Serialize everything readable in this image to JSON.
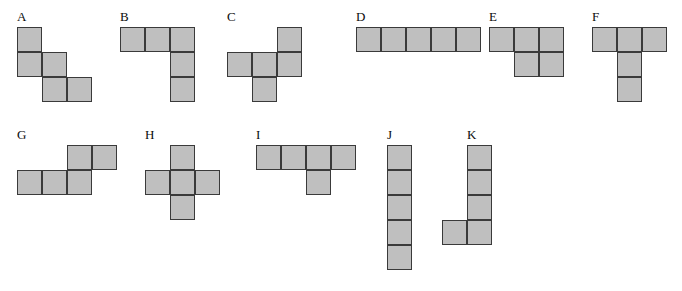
{
  "figure": {
    "background_color": "#ffffff",
    "cell_fill_color": "#bfbfbf",
    "cell_stroke_color": "#3a3a3a",
    "label_color": "#0b0b0b",
    "cell_size": 25,
    "shapes": [
      {
        "label": "A",
        "name": "W-pentomino-staircase",
        "label_x": 17,
        "label_y": 10,
        "origin_x": 17,
        "origin_y": 27,
        "cols": 3,
        "rows": 3,
        "cells": [
          [
            0,
            0
          ],
          [
            1,
            0
          ],
          [
            1,
            1
          ],
          [
            2,
            1
          ],
          [
            2,
            2
          ]
        ],
        "cell_count": 5
      },
      {
        "label": "B",
        "name": "V-pentomino-corner",
        "label_x": 120,
        "label_y": 10,
        "origin_x": 120,
        "origin_y": 27,
        "cols": 3,
        "rows": 3,
        "cells": [
          [
            0,
            0
          ],
          [
            0,
            1
          ],
          [
            0,
            2
          ],
          [
            1,
            2
          ],
          [
            2,
            2
          ]
        ],
        "cell_count": 5
      },
      {
        "label": "C",
        "name": "F-pentomino",
        "label_x": 227,
        "label_y": 10,
        "origin_x": 227,
        "origin_y": 27,
        "cols": 3,
        "rows": 3,
        "cells": [
          [
            0,
            2
          ],
          [
            1,
            0
          ],
          [
            1,
            1
          ],
          [
            1,
            2
          ],
          [
            2,
            1
          ]
        ],
        "cell_count": 5
      },
      {
        "label": "D",
        "name": "I-pentomino-horizontal",
        "label_x": 356,
        "label_y": 10,
        "origin_x": 356,
        "origin_y": 27,
        "cols": 5,
        "rows": 1,
        "cells": [
          [
            0,
            0
          ],
          [
            0,
            1
          ],
          [
            0,
            2
          ],
          [
            0,
            3
          ],
          [
            0,
            4
          ]
        ],
        "cell_count": 5
      },
      {
        "label": "E",
        "name": "P-pentomino",
        "label_x": 489,
        "label_y": 10,
        "origin_x": 489,
        "origin_y": 27,
        "cols": 3,
        "rows": 2,
        "cells": [
          [
            0,
            0
          ],
          [
            0,
            1
          ],
          [
            0,
            2
          ],
          [
            1,
            1
          ],
          [
            1,
            2
          ]
        ],
        "cell_count": 5
      },
      {
        "label": "F",
        "name": "T-pentomino",
        "label_x": 592,
        "label_y": 10,
        "origin_x": 592,
        "origin_y": 27,
        "cols": 3,
        "rows": 3,
        "cells": [
          [
            0,
            0
          ],
          [
            0,
            1
          ],
          [
            0,
            2
          ],
          [
            1,
            1
          ],
          [
            2,
            1
          ]
        ],
        "cell_count": 5
      },
      {
        "label": "G",
        "name": "N-pentomino-offset",
        "label_x": 17,
        "label_y": 128,
        "origin_x": 17,
        "origin_y": 145,
        "cols": 4,
        "rows": 2,
        "cells": [
          [
            0,
            2
          ],
          [
            0,
            3
          ],
          [
            1,
            0
          ],
          [
            1,
            1
          ],
          [
            1,
            2
          ]
        ],
        "cell_count": 5
      },
      {
        "label": "H",
        "name": "X-pentomino-plus",
        "label_x": 145,
        "label_y": 128,
        "origin_x": 145,
        "origin_y": 145,
        "cols": 3,
        "rows": 3,
        "cells": [
          [
            0,
            1
          ],
          [
            1,
            0
          ],
          [
            1,
            1
          ],
          [
            1,
            2
          ],
          [
            2,
            1
          ]
        ],
        "cell_count": 5
      },
      {
        "label": "I",
        "name": "Y-pentomino",
        "label_x": 256,
        "label_y": 128,
        "origin_x": 256,
        "origin_y": 145,
        "cols": 4,
        "rows": 2,
        "cells": [
          [
            0,
            0
          ],
          [
            0,
            1
          ],
          [
            0,
            2
          ],
          [
            0,
            3
          ],
          [
            1,
            2
          ]
        ],
        "cell_count": 5
      },
      {
        "label": "J",
        "name": "I-pentomino-vertical",
        "label_x": 387,
        "label_y": 128,
        "origin_x": 387,
        "origin_y": 145,
        "cols": 1,
        "rows": 5,
        "cells": [
          [
            0,
            0
          ],
          [
            1,
            0
          ],
          [
            2,
            0
          ],
          [
            3,
            0
          ],
          [
            4,
            0
          ]
        ],
        "cell_count": 5
      },
      {
        "label": "K",
        "name": "L-pentomino",
        "label_x": 467,
        "label_y": 128,
        "origin_x": 442,
        "origin_y": 145,
        "cols": 2,
        "rows": 4,
        "cells": [
          [
            0,
            1
          ],
          [
            1,
            1
          ],
          [
            2,
            1
          ],
          [
            3,
            0
          ],
          [
            3,
            1
          ]
        ],
        "cell_count": 5
      }
    ]
  }
}
